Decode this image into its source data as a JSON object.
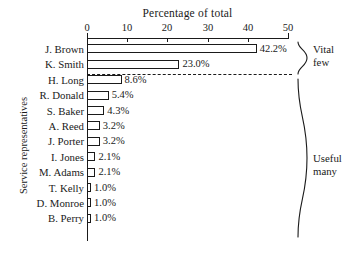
{
  "chart_data": {
    "type": "bar",
    "orientation": "horizontal",
    "title": "Percentage of total",
    "xlabel": "Percentage of total",
    "ylabel": "Service representatives",
    "xlim": [
      0,
      50
    ],
    "xticks": [
      0,
      10,
      20,
      30,
      40,
      50
    ],
    "xtick_labels": [
      "0",
      "10",
      "20",
      "30",
      "40",
      "50"
    ],
    "grid": false,
    "legend": false,
    "categories": [
      "J. Brown",
      "K. Smith",
      "H. Long",
      "R. Donald",
      "S. Baker",
      "A. Reed",
      "J. Porter",
      "I. Jones",
      "M. Adams",
      "T. Kelly",
      "D. Monroe",
      "B. Perry"
    ],
    "values": [
      42.2,
      23.0,
      8.6,
      5.4,
      4.3,
      3.2,
      3.2,
      2.1,
      2.1,
      1.0,
      1.0,
      1.0
    ],
    "data_labels": [
      "42.2%",
      "23.0%",
      "8.6%",
      "5.4%",
      "4.3%",
      "3.2%",
      "3.2%",
      "2.1%",
      "2.1%",
      "1.0%",
      "1.0%",
      "1.0%"
    ],
    "annotations": [
      {
        "label_line1": "Vital",
        "label_line2": "few",
        "spans": [
          "J. Brown",
          "K. Smith"
        ]
      },
      {
        "label_line1": "Useful",
        "label_line2": "many",
        "spans": [
          "H. Long",
          "B. Perry"
        ]
      }
    ],
    "separator": {
      "type": "dashed-line",
      "after_category": "K. Smith"
    },
    "colors": {
      "bar_fill": "#ffffff",
      "bar_stroke": "#1a1a1a",
      "text": "#1a1a1a",
      "background": "#ffffff"
    }
  }
}
